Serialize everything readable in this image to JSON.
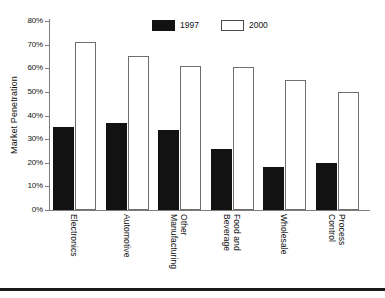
{
  "chart_data": {
    "type": "bar",
    "title": "",
    "subtitle": "",
    "xlabel": "",
    "ylabel": "Market Penetration",
    "ylim": [
      0,
      80
    ],
    "ytick_labels": [
      "80%",
      "70%",
      "60%",
      "50%",
      "40%",
      "30%",
      "20%",
      "10%",
      "0%"
    ],
    "ytick_values": [
      80,
      70,
      60,
      50,
      40,
      30,
      20,
      10,
      0
    ],
    "grid": false,
    "legend_position": "top-center",
    "categories": [
      "Electronics",
      "Automotive",
      "Other\nManufacturing",
      "Food and\nBeverage",
      "Wholesale",
      "Process\nControl"
    ],
    "series": [
      {
        "name": "1997",
        "color": "#121212",
        "values": [
          35,
          37,
          34,
          26,
          18,
          20
        ]
      },
      {
        "name": "2000",
        "color": "#ffffff",
        "values": [
          71,
          65,
          61,
          60.5,
          55,
          50
        ]
      }
    ]
  },
  "legend": {
    "items": [
      {
        "label": "1997",
        "style": "filled"
      },
      {
        "label": "2000",
        "style": "outlined"
      }
    ]
  },
  "colors": {
    "series_1997": "#121212",
    "series_2000": "#ffffff",
    "axis": "#7d7d7d",
    "bar_outline": "#6e6e6e",
    "text": "#111111",
    "background": "#ffffff"
  }
}
